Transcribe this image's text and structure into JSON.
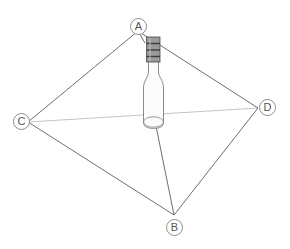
{
  "figure": {
    "type": "geometric-diagram",
    "background_color": "#ffffff",
    "line_color": "#6b6b6b",
    "faint_line_color": "#b9b9b9",
    "label_circle_color": "#8d8d8d",
    "label_text_color": "#555555",
    "vertices": [
      {
        "id": "A",
        "label": "A",
        "x": 138,
        "y": 31,
        "label_x": 130,
        "label_y": 18
      },
      {
        "id": "B",
        "label": "B",
        "x": 174,
        "y": 215,
        "label_x": 166,
        "label_y": 219
      },
      {
        "id": "C",
        "label": "C",
        "x": 28,
        "y": 122,
        "label_x": 17,
        "label_y": 114
      },
      {
        "id": "D",
        "label": "D",
        "x": 258,
        "y": 108,
        "label_x": 258,
        "label_y": 100
      }
    ],
    "edges": [
      {
        "from": "A",
        "to": "C",
        "style": "solid"
      },
      {
        "from": "C",
        "to": "B",
        "style": "solid"
      },
      {
        "from": "B",
        "to": "D",
        "style": "solid"
      },
      {
        "from": "D",
        "to": "A",
        "style": "solid"
      }
    ],
    "diagonals": [
      {
        "from": "C",
        "to": "D",
        "style": "faint"
      },
      {
        "from": "A",
        "to": "B",
        "style": "solid",
        "note": "passes behind bottle"
      }
    ],
    "bottle": {
      "name": "wine-bottle",
      "center_x": 153,
      "cap_top_y": 37,
      "cap_bottom_y": 62,
      "base_y": 126,
      "body_left_x": 143,
      "body_right_x": 164,
      "neck_left_x": 148,
      "neck_right_x": 159,
      "cap_color": "#8a8a8a",
      "cap_ridge_color": "#3c3c3c",
      "glass_outline_color": "#777777",
      "glass_fill_color": "#fbfbfb",
      "ridge_count": 3
    }
  }
}
